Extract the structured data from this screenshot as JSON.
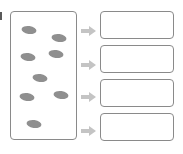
{
  "diagram": {
    "type": "sorting-worksheet",
    "colors": {
      "border": "#8a8a8a",
      "blob": "#8f8f8f",
      "arrow": "#c4c4c4"
    },
    "source_box": {
      "items": [
        {
          "shape": "ellipse",
          "cx": 29,
          "cy": 30
        },
        {
          "shape": "ellipse",
          "cx": 59,
          "cy": 38
        },
        {
          "shape": "ellipse",
          "cx": 28,
          "cy": 57
        },
        {
          "shape": "ellipse",
          "cx": 56,
          "cy": 54
        },
        {
          "shape": "ellipse",
          "cx": 40,
          "cy": 78
        },
        {
          "shape": "ellipse",
          "cx": 27,
          "cy": 97
        },
        {
          "shape": "ellipse",
          "cx": 61,
          "cy": 95
        },
        {
          "shape": "ellipse",
          "cx": 34,
          "cy": 124
        }
      ]
    },
    "arrows": [
      {
        "icon": "right-arrow-icon",
        "cy": 27
      },
      {
        "icon": "right-arrow-icon",
        "cy": 61
      },
      {
        "icon": "right-arrow-icon",
        "cy": 93
      },
      {
        "icon": "right-arrow-icon",
        "cy": 127
      }
    ],
    "target_boxes": [
      {
        "top": 11,
        "content": ""
      },
      {
        "top": 45,
        "content": ""
      },
      {
        "top": 79,
        "content": ""
      },
      {
        "top": 113,
        "content": ""
      }
    ]
  }
}
